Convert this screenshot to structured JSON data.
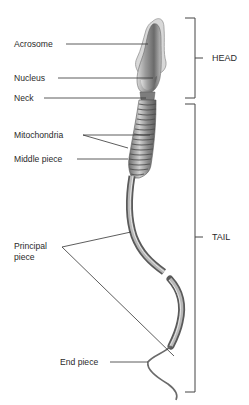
{
  "diagram": {
    "labels": {
      "acrosome": "Acrosome",
      "nucleus": "Nucleus",
      "neck": "Neck",
      "mitochondria": "Mitochondria",
      "middle_piece": "Middle piece",
      "principal_piece_line1": "Principal",
      "principal_piece_line2": "piece",
      "end_piece": "End piece"
    },
    "regions": {
      "head": "HEAD",
      "tail": "TAIL"
    },
    "colors": {
      "text": "#2a2a2a",
      "leader_lines": "#333333",
      "bracket": "#444444",
      "cell_dark": "#5a5a5a",
      "cell_mid": "#8c8c8c",
      "cell_light": "#c8c8c8"
    }
  }
}
